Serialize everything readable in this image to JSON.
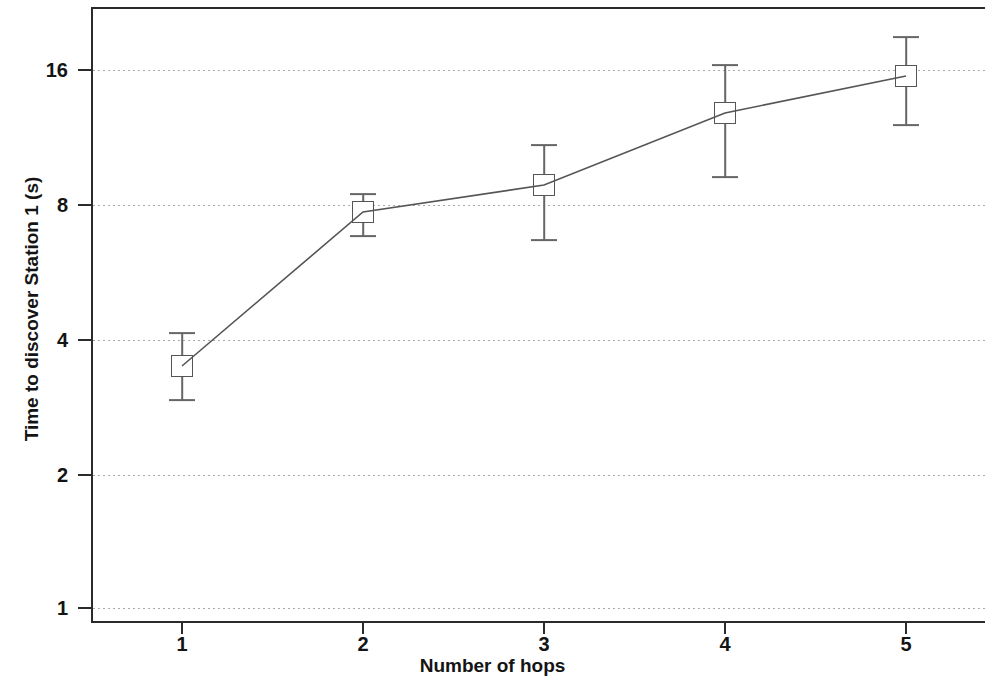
{
  "chart_data": {
    "type": "line",
    "title": "",
    "subtitle": "",
    "xlabel": "Number of hops",
    "ylabel": "Time to discover Station 1 (s)",
    "x": [
      1,
      2,
      3,
      4,
      5
    ],
    "xtick_labels": [
      "1",
      "2",
      "3",
      "4",
      "5"
    ],
    "ytick_labels": [
      "16",
      "8",
      "4",
      "2",
      "1"
    ],
    "ytick_values": [
      16,
      8,
      4,
      2,
      1
    ],
    "yscale": "log2",
    "ylim": [
      1,
      21
    ],
    "xlim": [
      0.55,
      5.45
    ],
    "grid": true,
    "grid_axis": "y",
    "grid_style": "dotted",
    "legend": "none",
    "marker": "open-square",
    "line_color": "#555555",
    "marker_color": "#555555",
    "errorbar_color": "#666666",
    "series": [
      {
        "name": "Time to discover Station 1",
        "values": [
          3.5,
          7.8,
          8.9,
          13.0,
          15.7
        ],
        "yerr_low": [
          2.95,
          6.9,
          6.8,
          9.4,
          12.2
        ],
        "yerr_high": [
          4.15,
          8.8,
          11.4,
          17.5,
          20.5
        ]
      }
    ],
    "points": [
      {
        "x": 1,
        "y": 3.5,
        "err_low": 2.95,
        "err_high": 4.15
      },
      {
        "x": 2,
        "y": 7.8,
        "err_low": 6.9,
        "err_high": 8.8
      },
      {
        "x": 3,
        "y": 8.9,
        "err_low": 6.8,
        "err_high": 11.4
      },
      {
        "x": 4,
        "y": 13.0,
        "err_low": 9.4,
        "err_high": 17.5
      },
      {
        "x": 5,
        "y": 15.7,
        "err_low": 12.2,
        "err_high": 20.5
      }
    ]
  },
  "axes": {
    "y_ticks": [
      {
        "label": "16",
        "px": 70
      },
      {
        "label": "8",
        "px": 205
      },
      {
        "label": "4",
        "px": 340
      },
      {
        "label": "2",
        "px": 475
      },
      {
        "label": "1",
        "px": 608
      }
    ],
    "x_ticks": [
      {
        "label": "1",
        "px": 182
      },
      {
        "label": "2",
        "px": 363
      },
      {
        "label": "3",
        "px": 544
      },
      {
        "label": "4",
        "px": 725
      },
      {
        "label": "5",
        "px": 906
      }
    ]
  },
  "geometry": {
    "points_px": [
      {
        "cx": 182,
        "cy": 366,
        "top": 333,
        "bottom": 400
      },
      {
        "cx": 363,
        "cy": 212,
        "top": 194,
        "bottom": 236
      },
      {
        "cx": 544,
        "cy": 185,
        "top": 145,
        "bottom": 240
      },
      {
        "cx": 725,
        "cy": 113,
        "top": 65,
        "bottom": 177
      },
      {
        "cx": 906,
        "cy": 76,
        "top": 37,
        "bottom": 125
      }
    ],
    "polyline": "182,366 363,212 544,185 725,113 906,76"
  }
}
